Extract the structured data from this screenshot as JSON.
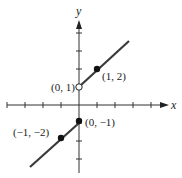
{
  "figure": {
    "type": "piecewise-function-graph",
    "axes": {
      "x_label": "x",
      "y_label": "y"
    },
    "x_ticks": [
      -4,
      -3,
      -2,
      -1,
      1,
      2,
      3,
      4
    ],
    "y_ticks": [
      -3,
      -2,
      -1,
      1,
      2,
      3,
      4
    ],
    "pieces": [
      {
        "name": "upper-ray",
        "slope": 1,
        "intercept": 1,
        "domain": "x > 0",
        "start_point": "open",
        "color": "#333333"
      },
      {
        "name": "lower-ray",
        "slope": 1,
        "intercept": -1,
        "domain": "x <= 0",
        "end_point": "closed",
        "color": "#333333"
      }
    ],
    "points": [
      {
        "label": "(0, 1)",
        "x": 0,
        "y": 1,
        "style": "open"
      },
      {
        "label": "(1, 2)",
        "x": 1,
        "y": 2,
        "style": "filled"
      },
      {
        "label": "(0, −1)",
        "x": 0,
        "y": -1,
        "style": "filled"
      },
      {
        "label": "(−1, −2)",
        "x": -1,
        "y": -2,
        "style": "filled"
      }
    ]
  },
  "colors": {
    "axis": "#333333",
    "line": "#3a3a3a",
    "point": "#111111",
    "background": "#ffffff"
  }
}
